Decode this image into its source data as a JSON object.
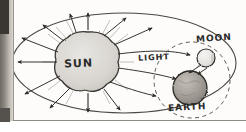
{
  "diagram": {
    "medium": "hand-drawn pencil sketch on paper",
    "background_color": "#fdfcfa",
    "ink_color": "#2b2b2b",
    "labels": {
      "sun": "SUN",
      "light": "LIGHT",
      "moon": "MOON",
      "earth": "EARTH"
    },
    "bodies": [
      {
        "name": "sun",
        "label": "SUN",
        "shape": "irregular-blob",
        "cx": 88,
        "cy": 62,
        "r": 30,
        "fill": "#dcdad6",
        "stroke": "#3a3734"
      },
      {
        "name": "moon",
        "label": "MOON",
        "shape": "circle",
        "cx": 206,
        "cy": 58,
        "r": 9,
        "fill": "#efeeec",
        "stroke": "#2f2d2a"
      },
      {
        "name": "earth",
        "label": "EARTH",
        "shape": "circle",
        "cx": 190,
        "cy": 88,
        "r": 17,
        "fill": "#a9a49d",
        "stroke": "#2b2926"
      }
    ],
    "boundary_ellipse": {
      "name": "light-field-boundary",
      "cx": 124,
      "cy": 63,
      "rx": 112,
      "ry": 50,
      "style": "solid thin pencil line"
    },
    "moon_orbit": {
      "name": "moon-orbit",
      "cx": 192,
      "cy": 80,
      "r": 38,
      "style": "dashed"
    },
    "light_rays": {
      "count": 14,
      "description": "straight arrows radiating outward from the sun in all directions",
      "arrow_targets": [
        "up",
        "up-left",
        "left",
        "down-left",
        "down",
        "down-right",
        "right toward moon",
        "right toward earth"
      ]
    },
    "reflected_rays": {
      "count": 2,
      "description": "arrows from the moon pointing down toward the earth"
    }
  }
}
